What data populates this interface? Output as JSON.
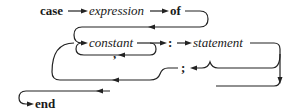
{
  "diagram": {
    "type": "syntax-diagram",
    "terminals": {
      "case": "case",
      "of": "of",
      "colon": ":",
      "comma": ",",
      "semicolon": ";",
      "end": "end"
    },
    "nonterminals": {
      "expression": "expression",
      "constant": "constant",
      "statement": "statement"
    }
  }
}
